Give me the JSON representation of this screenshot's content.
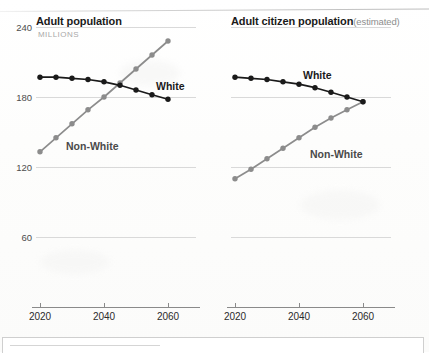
{
  "page": {
    "background_color": "#ffffff",
    "series_colors": {
      "white": "#1a1a1a",
      "nonwhite": "#8c8c8c"
    },
    "gridline_color": "#d9d9d9",
    "axis_color": "#8a8a8a"
  },
  "charts": {
    "left": {
      "title": "Adult population",
      "title_note": "",
      "subtitle": "MILLIONS",
      "label_white": "White",
      "label_nonwhite": "Non-White",
      "yticks": [
        "240",
        "180",
        "120",
        "60"
      ],
      "xticks": [
        "2020",
        "2040",
        "2060"
      ]
    },
    "right": {
      "title": "Adult citizen population",
      "title_note": "(estimated)",
      "subtitle": "",
      "label_white": "White",
      "label_nonwhite": "Non-White",
      "yticks": [
        "",
        "",
        "",
        ""
      ],
      "xticks": [
        "2020",
        "2040",
        "2060"
      ]
    }
  },
  "chart_data": [
    {
      "id": "adult-population",
      "type": "line",
      "title": "Adult population",
      "subtitle": "MILLIONS",
      "xlabel": "",
      "ylabel": "MILLIONS",
      "x": [
        2020,
        2025,
        2030,
        2035,
        2040,
        2045,
        2050,
        2055,
        2060
      ],
      "xlim": [
        2018,
        2062
      ],
      "ylim": [
        0,
        240
      ],
      "yticks": [
        60,
        120,
        180,
        240
      ],
      "xticks": [
        2020,
        2040,
        2060
      ],
      "grid": true,
      "legend": "inline-labels",
      "series": [
        {
          "name": "White",
          "color": "#1a1a1a",
          "values": [
            197,
            197,
            196,
            195,
            193,
            190,
            186,
            182,
            178
          ]
        },
        {
          "name": "Non-White",
          "color": "#8c8c8c",
          "values": [
            133,
            145,
            157,
            169,
            180,
            192,
            204,
            216,
            228
          ]
        }
      ],
      "annotations": [
        {
          "text": "White",
          "near_x": 2057,
          "near_y": 192
        },
        {
          "text": "Non-White",
          "near_x": 2031,
          "near_y": 146
        }
      ]
    },
    {
      "id": "adult-citizen-population",
      "type": "line",
      "title": "Adult citizen population",
      "title_note": "(estimated)",
      "subtitle": "",
      "xlabel": "",
      "ylabel": "MILLIONS",
      "x": [
        2020,
        2025,
        2030,
        2035,
        2040,
        2045,
        2050,
        2055,
        2060
      ],
      "xlim": [
        2018,
        2062
      ],
      "ylim": [
        0,
        240
      ],
      "yticks": [
        60,
        120,
        180,
        240
      ],
      "xticks": [
        2020,
        2040,
        2060
      ],
      "grid": true,
      "legend": "inline-labels",
      "series": [
        {
          "name": "White",
          "color": "#1a1a1a",
          "values": [
            197,
            196,
            195,
            193,
            191,
            188,
            184,
            180,
            176
          ]
        },
        {
          "name": "Non-White",
          "color": "#8c8c8c",
          "values": [
            110,
            118,
            127,
            136,
            145,
            154,
            162,
            169,
            176
          ]
        }
      ],
      "annotations": [
        {
          "text": "White",
          "near_x": 2041,
          "near_y": 203
        },
        {
          "text": "Non-White",
          "near_x": 2044,
          "near_y": 141
        }
      ]
    }
  ]
}
